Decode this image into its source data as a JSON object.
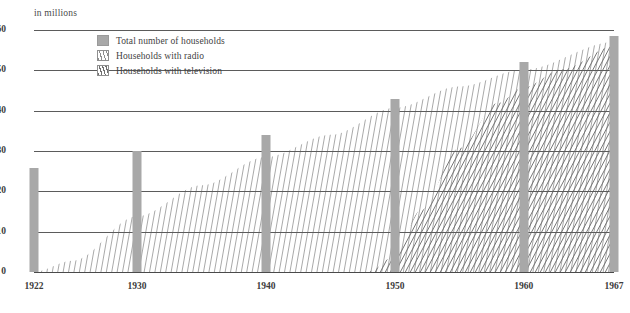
{
  "chart_data": {
    "type": "bar",
    "title": "",
    "subtitle": "",
    "unit_caption": "in millions",
    "xlabel": "",
    "ylabel": "",
    "ylim": [
      0,
      60
    ],
    "yticks": [
      0,
      10,
      20,
      30,
      40,
      50,
      60
    ],
    "ytick_labels": [
      "0",
      "10",
      "20",
      "30",
      "40",
      "50",
      "60"
    ],
    "grid": true,
    "legend_position": "top-left-inside",
    "categories": [
      "1922",
      "1930",
      "1940",
      "1950",
      "1960",
      "1967"
    ],
    "xtick_labels": [
      "1922",
      "1930",
      "1940",
      "1950",
      "1960",
      "1967"
    ],
    "x_range": [
      1922,
      1967
    ],
    "series": [
      {
        "name": "Total number of households",
        "style": "bar",
        "color": "#a8a8a8",
        "x": [
          1922,
          1930,
          1940,
          1950,
          1960,
          1967
        ],
        "values": [
          25.7,
          29.9,
          34.0,
          43.0,
          52.0,
          58.5
        ]
      },
      {
        "name": "Households with radio",
        "style": "hatched-area",
        "color": "#9a9a9a",
        "x": [
          1922,
          1925,
          1930,
          1935,
          1940,
          1945,
          1950,
          1955,
          1960,
          1967
        ],
        "values": [
          0.06,
          2.8,
          13.8,
          21.5,
          28.5,
          34.0,
          40.7,
          46.0,
          50.2,
          57.0
        ]
      },
      {
        "name": "Households with television",
        "style": "hatched-area",
        "color": "#6f6f6f",
        "x": [
          1948,
          1950,
          1952,
          1955,
          1958,
          1960,
          1963,
          1967
        ],
        "values": [
          0.2,
          3.9,
          15.3,
          30.7,
          41.9,
          45.8,
          50.3,
          56.0
        ]
      }
    ],
    "annotations": []
  },
  "legend": {
    "items": [
      {
        "label": "Total number of households",
        "swatch": "solid-gray-swatch"
      },
      {
        "label": "Households with radio",
        "swatch": "hatched-light-swatch"
      },
      {
        "label": "Households with television",
        "swatch": "hatched-dark-swatch"
      }
    ]
  },
  "colors": {
    "bar": "#a8a8a8",
    "radio_hatch": "#9a9a9a",
    "tv_hatch": "#6f6f6f",
    "gridline": "#5b5b5b",
    "text": "#3c3c3c",
    "background": "#ffffff"
  }
}
